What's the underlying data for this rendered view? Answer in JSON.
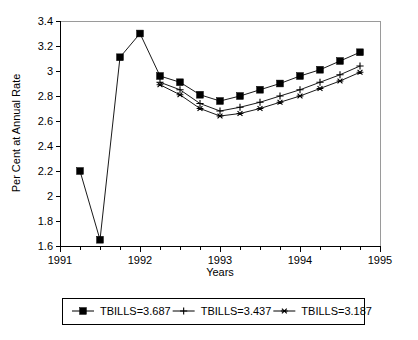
{
  "chart_data": {
    "type": "line",
    "title": "",
    "xlabel": "Years",
    "ylabel": "Per Cent at Annual Rate",
    "xlim": [
      1991,
      1995
    ],
    "ylim": [
      1.6,
      3.4
    ],
    "grid": false,
    "legend_position": "bottom",
    "xticks": [
      1991,
      1992,
      1993,
      1994,
      1995
    ],
    "xtick_labels": [
      "1991",
      "1992",
      "1993",
      "1994",
      "1995"
    ],
    "xminor_step": 0.25,
    "yticks": [
      1.6,
      1.8,
      2.0,
      2.2,
      2.4,
      2.6,
      2.8,
      3.0,
      3.2,
      3.4
    ],
    "ytick_labels": [
      "1.6",
      "1.8",
      "2",
      "2.2",
      "2.4",
      "2.6",
      "2.8",
      "3",
      "3.2",
      "3.4"
    ],
    "series": [
      {
        "name": "TBILLS=3.687",
        "marker": "filled-square",
        "x": [
          1991.25,
          1991.5,
          1991.75,
          1992.0,
          1992.25,
          1992.5,
          1992.75,
          1993.0,
          1993.25,
          1993.5,
          1993.75,
          1994.0,
          1994.25,
          1994.5,
          1994.75
        ],
        "values": [
          2.2,
          1.65,
          3.11,
          3.3,
          2.96,
          2.91,
          2.81,
          2.76,
          2.8,
          2.85,
          2.9,
          2.96,
          3.01,
          3.08,
          3.15
        ]
      },
      {
        "name": "TBILLS=3.437",
        "marker": "plus",
        "x": [
          1992.25,
          1992.5,
          1992.75,
          1993.0,
          1993.25,
          1993.5,
          1993.75,
          1994.0,
          1994.25,
          1994.5,
          1994.75
        ],
        "values": [
          2.91,
          2.85,
          2.74,
          2.68,
          2.71,
          2.75,
          2.8,
          2.85,
          2.91,
          2.97,
          3.04
        ]
      },
      {
        "name": "TBILLS=3.187",
        "marker": "asterisk",
        "x": [
          1992.25,
          1992.5,
          1992.75,
          1993.0,
          1993.25,
          1993.5,
          1993.75,
          1994.0,
          1994.25,
          1994.5,
          1994.75
        ],
        "values": [
          2.89,
          2.81,
          2.7,
          2.64,
          2.66,
          2.7,
          2.75,
          2.8,
          2.86,
          2.92,
          2.99
        ]
      }
    ]
  },
  "legend": {
    "items": [
      {
        "label": "TBILLS=3.687",
        "marker": "filled-square"
      },
      {
        "label": "TBILLS=3.437",
        "marker": "plus"
      },
      {
        "label": "TBILLS=3.187",
        "marker": "asterisk"
      }
    ]
  },
  "colors": {
    "ink": "#000000",
    "frame": "#9a9a9a",
    "background": "#ffffff"
  }
}
